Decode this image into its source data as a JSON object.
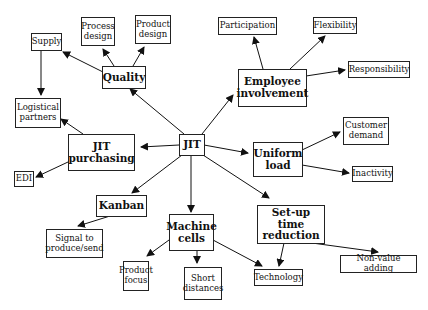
{
  "diagram": {
    "center": {
      "id": "jit",
      "label": "JIT"
    },
    "major_nodes": [
      {
        "id": "quality",
        "label": "Quality"
      },
      {
        "id": "employee_involvement",
        "label": "Employee\ninvolvement"
      },
      {
        "id": "jit_purchasing",
        "label": "JIT\npurchasing"
      },
      {
        "id": "uniform_load",
        "label": "Uniform\nload"
      },
      {
        "id": "kanban",
        "label": "Kanban"
      },
      {
        "id": "machine_cells",
        "label": "Machine\ncells"
      },
      {
        "id": "setup_time_reduction",
        "label": "Set-up time\nreduction"
      }
    ],
    "leaf_nodes": [
      {
        "id": "supply",
        "label": "Supply"
      },
      {
        "id": "process_design",
        "label": "Process\ndesign"
      },
      {
        "id": "product_design",
        "label": "Product\ndesign"
      },
      {
        "id": "logistical_partners",
        "label": "Logistical\npartners"
      },
      {
        "id": "edi",
        "label": "EDI"
      },
      {
        "id": "signal",
        "label": "Signal to\nproduce/send"
      },
      {
        "id": "product_focus",
        "label": "Product\nfocus"
      },
      {
        "id": "short_distances",
        "label": "Short\ndistances"
      },
      {
        "id": "participation",
        "label": "Participation"
      },
      {
        "id": "flexibility",
        "label": "Flexibility"
      },
      {
        "id": "responsibility",
        "label": "Responsibility"
      },
      {
        "id": "customer_demand",
        "label": "Customer\ndemand"
      },
      {
        "id": "inactivity",
        "label": "Inactivity"
      },
      {
        "id": "technology",
        "label": "Technology"
      },
      {
        "id": "non_value_adding",
        "label": "Non-value adding"
      }
    ],
    "edges": [
      [
        "jit",
        "quality"
      ],
      [
        "jit",
        "employee_involvement"
      ],
      [
        "jit",
        "jit_purchasing"
      ],
      [
        "jit",
        "uniform_load"
      ],
      [
        "jit",
        "kanban"
      ],
      [
        "jit",
        "machine_cells"
      ],
      [
        "jit",
        "setup_time_reduction"
      ],
      [
        "quality",
        "supply"
      ],
      [
        "quality",
        "process_design"
      ],
      [
        "quality",
        "product_design"
      ],
      [
        "supply",
        "logistical_partners"
      ],
      [
        "jit_purchasing",
        "logistical_partners"
      ],
      [
        "jit_purchasing",
        "edi"
      ],
      [
        "kanban",
        "signal"
      ],
      [
        "machine_cells",
        "product_focus"
      ],
      [
        "machine_cells",
        "short_distances"
      ],
      [
        "machine_cells",
        "technology"
      ],
      [
        "employee_involvement",
        "participation"
      ],
      [
        "employee_involvement",
        "flexibility"
      ],
      [
        "employee_involvement",
        "responsibility"
      ],
      [
        "uniform_load",
        "customer_demand"
      ],
      [
        "uniform_load",
        "inactivity"
      ],
      [
        "setup_time_reduction",
        "technology"
      ],
      [
        "setup_time_reduction",
        "non_value_adding"
      ]
    ],
    "colors": {
      "line": "#111111",
      "box_border": "#222222",
      "background": "#ffffff"
    }
  }
}
